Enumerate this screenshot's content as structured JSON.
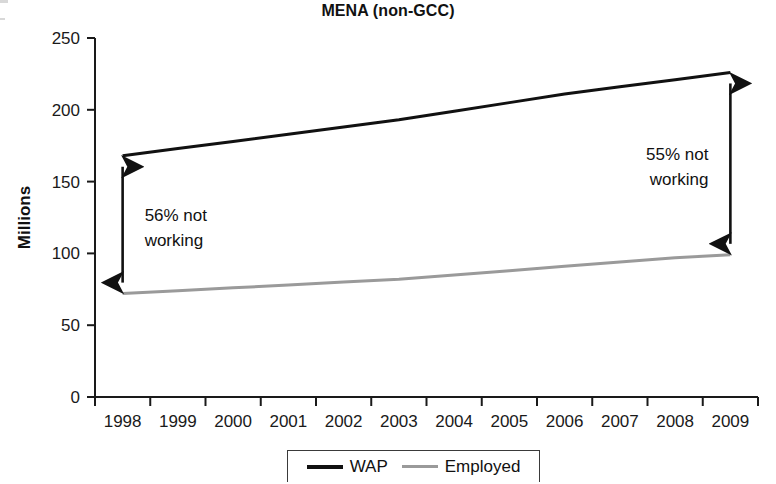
{
  "chart_data": {
    "type": "line",
    "title": "MENA (non-GCC)",
    "xlabel": "",
    "ylabel": "Millions",
    "x": [
      1998,
      1999,
      2000,
      2001,
      2002,
      2003,
      2004,
      2005,
      2006,
      2007,
      2008,
      2009
    ],
    "xtick_labels": [
      "1998",
      "1999",
      "2000",
      "2001",
      "2002",
      "2003",
      "2004",
      "2005",
      "2006",
      "2007",
      "2008",
      "2009"
    ],
    "ytick_labels": [
      "0",
      "50",
      "100",
      "150",
      "200",
      "250"
    ],
    "yticks": [
      0,
      50,
      100,
      150,
      200,
      250
    ],
    "ylim": [
      0,
      250
    ],
    "grid": false,
    "legend_position": "bottom-center",
    "series": [
      {
        "name": "WAP",
        "color": "#111111",
        "width": 3,
        "values": [
          168,
          173,
          178,
          183,
          188,
          193,
          199,
          205,
          211,
          216,
          221,
          226
        ]
      },
      {
        "name": "Employed",
        "color": "#9a9a9a",
        "width": 3,
        "values": [
          72,
          74,
          76,
          78,
          80,
          82,
          85,
          88,
          91,
          94,
          97,
          99
        ]
      }
    ],
    "annotations": [
      {
        "id": "left-gap",
        "text_line1": "56% not",
        "text_line2": "working",
        "year": 1998,
        "from_value": 72,
        "to_value": 168,
        "arrow": "double"
      },
      {
        "id": "right-gap",
        "text_line1": "55% not",
        "text_line2": "working",
        "year": 2009,
        "from_value": 99,
        "to_value": 226,
        "arrow": "double"
      }
    ]
  },
  "legend": {
    "items": [
      {
        "label": "WAP"
      },
      {
        "label": "Employed"
      }
    ]
  }
}
